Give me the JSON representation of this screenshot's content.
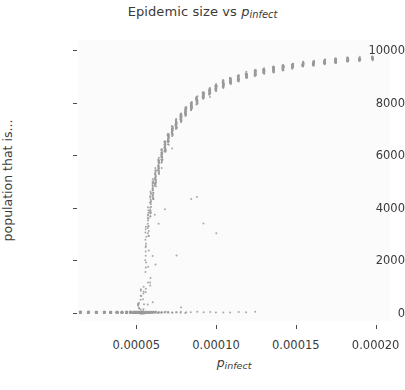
{
  "figure": {
    "width": 405,
    "height": 390,
    "background": "#ffffff",
    "plot_background": "#fbfbfb",
    "point_color": "#9a9a9a"
  },
  "title": {
    "prefix": "Epidemic size vs ",
    "var": "p",
    "sub": "infect"
  },
  "axis_labels": {
    "x_var": "p",
    "x_sub": "infect",
    "y": "population that is..."
  },
  "ticks": {
    "x_labels": [
      "0.00005",
      "0.00010",
      "0.00015",
      "0.00020"
    ],
    "x_values": [
      5e-05,
      0.0001,
      0.00015,
      0.0002
    ],
    "y_labels": [
      "0",
      "2000",
      "4000",
      "6000",
      "8000",
      "10000"
    ],
    "y_values": [
      0,
      2000,
      4000,
      6000,
      8000,
      10000
    ]
  },
  "chart_data": {
    "type": "scatter",
    "xlabel": "p_infect",
    "ylabel": "population that is...",
    "xlim": [
      1.35e-05,
      0.000209
    ],
    "ylim": [
      -320,
      10400
    ],
    "grid": false,
    "legend": null,
    "marker": {
      "shape": "circle",
      "size_px": 2.0,
      "color": "#9a9a9a",
      "opacity": 0.85
    },
    "x": [
      1.5e-05,
      2e-05,
      2.5e-05,
      3e-05,
      3.4e-05,
      3.8e-05,
      4.1e-05,
      4.4e-05,
      4.65e-05,
      4.85e-05,
      5e-05,
      5.15e-05,
      5.3e-05,
      5.45e-05,
      5.6e-05,
      5.75e-05,
      5.9e-05,
      6.05e-05,
      6.2e-05,
      6.4e-05,
      6.6e-05,
      6.8e-05,
      7e-05,
      7.25e-05,
      7.5e-05,
      7.8e-05,
      8.1e-05,
      8.45e-05,
      8.8e-05,
      9.2e-05,
      9.6e-05,
      0.0001,
      0.0001045,
      0.000109,
      0.000114,
      0.000119,
      0.0001245,
      0.00013,
      0.000136,
      0.000142,
      0.000148,
      0.0001545,
      0.000161,
      0.000168,
      0.000175,
      0.0001825,
      0.00019,
      0.000198
    ],
    "y_median": [
      0,
      0,
      0,
      0,
      0,
      0,
      0,
      0,
      0,
      0,
      120,
      430,
      900,
      1700,
      2700,
      3500,
      4150,
      4700,
      5150,
      5600,
      6000,
      6350,
      6650,
      6950,
      7200,
      7450,
      7680,
      7900,
      8100,
      8280,
      8440,
      8580,
      8720,
      8840,
      8950,
      9050,
      9140,
      9220,
      9290,
      9350,
      9410,
      9470,
      9520,
      9560,
      9600,
      9640,
      9670,
      9700
    ],
    "y_spread_low": [
      0,
      0,
      0,
      0,
      0,
      0,
      0,
      0,
      0,
      0,
      0,
      0,
      0,
      0,
      1900,
      2900,
      3650,
      4300,
      4800,
      5300,
      5750,
      6120,
      6450,
      6760,
      7020,
      7280,
      7520,
      7750,
      7960,
      8150,
      8310,
      8460,
      8600,
      8730,
      8845,
      8950,
      9045,
      9130,
      9205,
      9270,
      9335,
      9395,
      9450,
      9495,
      9540,
      9580,
      9615,
      9650
    ],
    "y_spread_high": [
      0,
      0,
      0,
      0,
      0,
      0,
      0,
      0,
      0,
      0,
      0,
      0,
      0,
      0,
      3300,
      4000,
      4600,
      5080,
      5480,
      5880,
      6230,
      6560,
      6840,
      7120,
      7360,
      7600,
      7820,
      8030,
      8225,
      8400,
      8555,
      8690,
      8830,
      8945,
      9050,
      9145,
      9235,
      9305,
      9370,
      9430,
      9485,
      9540,
      9585,
      9625,
      9660,
      9695,
      9725,
      9750
    ],
    "zero_branch_fraction": [
      1.0,
      1.0,
      1.0,
      1.0,
      1.0,
      1.0,
      1.0,
      1.0,
      1.0,
      1.0,
      1.0,
      0.96,
      0.9,
      0.8,
      0.62,
      0.45,
      0.34,
      0.26,
      0.2,
      0.16,
      0.13,
      0.1,
      0.09,
      0.07,
      0.06,
      0.05,
      0.05,
      0.04,
      0.04,
      0.03,
      0.03,
      0.03,
      0.02,
      0.02,
      0.02,
      0.02,
      0.02,
      0.01,
      0.01,
      0.01,
      0.01,
      0.01,
      0.01,
      0.01,
      0.01,
      0.01,
      0.01,
      0.01
    ],
    "runs_per_x": 30
  }
}
